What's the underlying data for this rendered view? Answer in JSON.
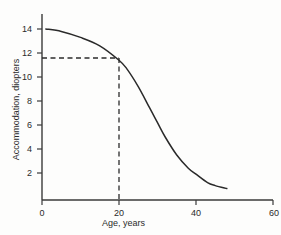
{
  "chart_data": {
    "type": "line",
    "title": "",
    "xlabel": "Age, years",
    "ylabel": "Accommodation, diopters",
    "xlim": [
      0,
      60
    ],
    "ylim": [
      0,
      15
    ],
    "grid": false,
    "legend": "none",
    "xticks": [
      0,
      20,
      40,
      60
    ],
    "xtick_labels": [
      "0",
      "20",
      "40",
      "60"
    ],
    "yticks": [
      2,
      4,
      6,
      8,
      10,
      12,
      14
    ],
    "ytick_labels": [
      "2",
      "4",
      "6",
      "8",
      "10",
      "12",
      "14"
    ],
    "series": [
      {
        "name": "Amplitude of accommodation",
        "x": [
          1,
          5,
          10,
          15,
          20,
          22,
          25,
          28,
          30,
          32,
          35,
          38,
          40,
          43,
          45,
          48
        ],
        "values": [
          14.0,
          13.8,
          13.3,
          12.6,
          11.4,
          10.7,
          9.2,
          7.4,
          6.2,
          5.0,
          3.5,
          2.4,
          1.9,
          1.2,
          0.95,
          0.7
        ]
      }
    ],
    "annotations": [
      {
        "name": "reference-lines",
        "style": "dashed",
        "x": 20,
        "y": 11.4,
        "description": "Dashed horizontal line from y-axis at 11.4 diopters and dashed vertical line from x-axis at age 20 meeting on the curve"
      }
    ]
  },
  "axes": {
    "x_title": "Age, years",
    "y_title": "Accommodation, diopters"
  }
}
